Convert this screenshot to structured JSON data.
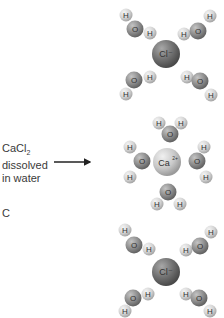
{
  "label": {
    "line1_main": "CaCl",
    "line1_sub": "2",
    "line2": "dissolved",
    "line3": "in water"
  },
  "panel_letter": "C",
  "ions": {
    "chloride_top": "Cl⁻",
    "calcium": "Ca",
    "calcium_charge": "2+",
    "chloride_bottom": "Cl⁻"
  },
  "atoms": {
    "oxygen": "O",
    "hydrogen": "H"
  },
  "colors": {
    "chloride": "#6e6e6e",
    "calcium": "#c9c9c9",
    "oxygen": "#8c8c8c",
    "hydrogen": "#d4d4d4",
    "arrow": "#222222"
  }
}
